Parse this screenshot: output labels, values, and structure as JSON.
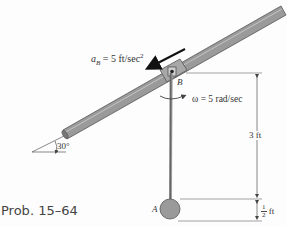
{
  "figure": {
    "caption": "Prob. 15–64",
    "colors": {
      "rod_fill": "#9a9a9a",
      "rod_edge": "#555555",
      "line": "#444444",
      "text": "#333333",
      "background": "#fdfdfd"
    }
  },
  "labels": {
    "accel_symbol": "a",
    "accel_sub": "B",
    "accel_value": " = 5 ft/sec",
    "accel_exp": "2",
    "omega": "ω = 5 rad/sec",
    "point_b": "B",
    "point_a": "A",
    "angle": "30°",
    "dim_long": "3 ft",
    "dim_short_num": "1",
    "dim_short_den": "2",
    "dim_short_unit": "ft"
  },
  "geometry": {
    "incline_angle_deg": 30,
    "pendulum_length_ft": 3,
    "ball_diameter_ft": 0.5,
    "collar_acceleration": "5 ft/sec²",
    "angular_velocity": "5 rad/sec"
  }
}
